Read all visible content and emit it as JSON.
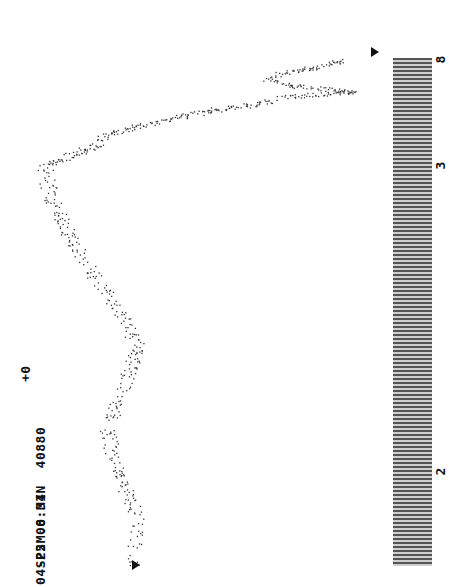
{
  "header": {
    "line1_label": "SP2M.0 MIN",
    "line1_value": "40880",
    "line2": "04-25 08:34",
    "offset": "+0"
  },
  "chart_data": {
    "type": "line",
    "title": "SP2M.0 MIN 40880",
    "subtitle": "04-25 08:34",
    "orientation": "rotated 90deg counter-clockwise",
    "x_tick_labels": [
      "2",
      "3",
      "8"
    ],
    "offset_label": "+0",
    "xlabel": "",
    "ylabel": "",
    "grid": false,
    "series": [
      {
        "name": "spectrum trace (relative level, 0=bottom,100=top)",
        "x": [
          2.0,
          2.1,
          2.2,
          2.3,
          2.4,
          2.5,
          2.6,
          2.7,
          2.8,
          2.9,
          3.0,
          3.1,
          3.3,
          3.6,
          4.0,
          4.5,
          5.0,
          5.3,
          5.6,
          5.9,
          6.2,
          6.6,
          7.0,
          7.4,
          7.8,
          8.0
        ],
        "values": [
          74,
          72,
          78,
          81,
          76,
          72,
          78,
          86,
          92,
          97,
          99,
          96,
          91,
          84,
          81,
          66,
          50,
          37,
          31,
          10,
          27,
          35,
          30,
          20,
          14,
          17
        ]
      }
    ],
    "markers": [
      "start marker at x=2",
      "end marker at x=8"
    ]
  }
}
